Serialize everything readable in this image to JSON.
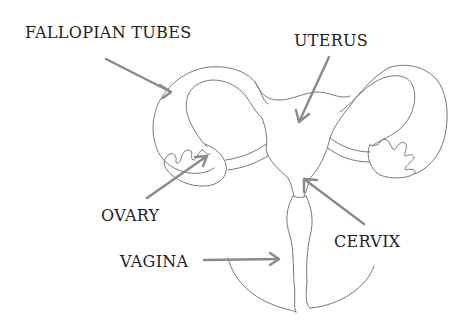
{
  "diagram": {
    "type": "anatomical-line-drawing",
    "colors": {
      "background": "#ffffff",
      "outline": "#777777",
      "arrow": "#8a8a8a",
      "text": "#222222"
    },
    "labels": {
      "fallopian_tubes": "FALLOPIAN TUBES",
      "uterus": "UTERUS",
      "ovary": "OVARY",
      "vagina": "VAGINA",
      "cervix": "CERVIX"
    }
  }
}
